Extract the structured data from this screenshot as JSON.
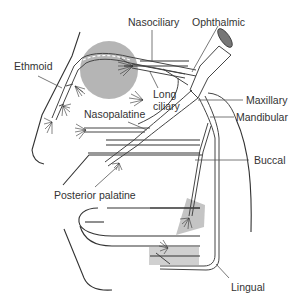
{
  "diagram": {
    "colors": {
      "nerve_stroke": "#444444",
      "shaded_region": "#bdbdbd",
      "orbit_circle": "#a8a8a8",
      "label_text": "#333333",
      "cut_end": "#777777"
    },
    "labels": {
      "nasociliary": "Nasociliary",
      "ophthalmic": "Ophthalmic",
      "ethmoid": "Ethmoid",
      "long_ciliary_line1": "Long",
      "long_ciliary_line2": "ciliary",
      "maxillary": "Maxillary",
      "mandibular": "Mandibular",
      "nasopalatine": "Nasopalatine",
      "buccal": "Buccal",
      "posterior_palatine": "Posterior palatine",
      "lingual": "Lingual"
    }
  }
}
